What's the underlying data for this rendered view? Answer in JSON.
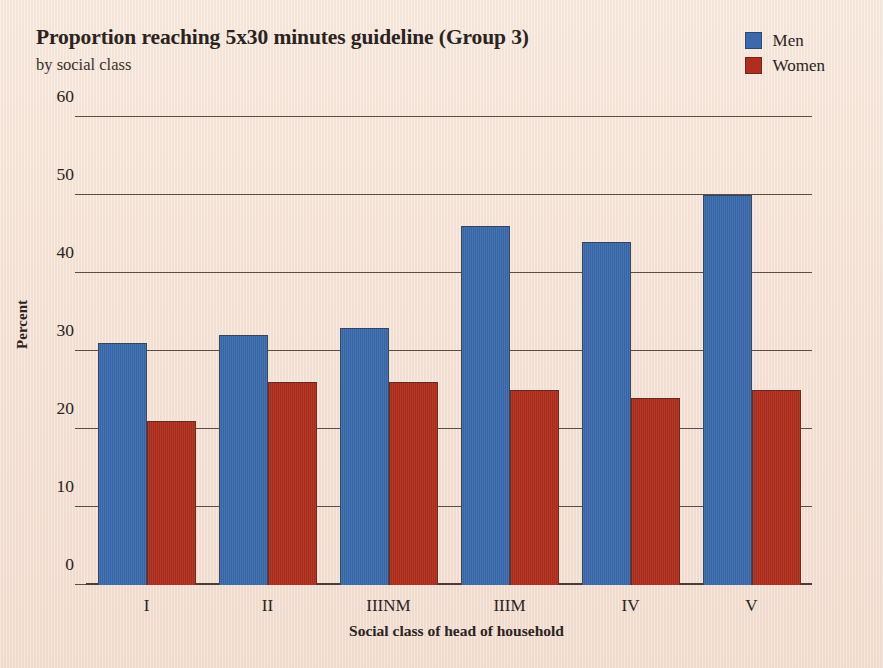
{
  "chart_data": {
    "type": "bar",
    "title": "Proportion reaching 5x30 minutes guideline (Group 3)",
    "subtitle": "by social class",
    "xlabel": "Social class of head of household",
    "ylabel": "Percent",
    "categories": [
      "I",
      "II",
      "IIINM",
      "IIIM",
      "IV",
      "V"
    ],
    "series": [
      {
        "name": "Men",
        "color": "#3a6aac",
        "values": [
          31,
          32,
          33,
          46,
          44,
          50
        ]
      },
      {
        "name": "Women",
        "color": "#b02e1e",
        "values": [
          21,
          26,
          26,
          25,
          24,
          25
        ]
      }
    ],
    "ylim": [
      0,
      60
    ],
    "yticks": [
      0,
      10,
      20,
      30,
      40,
      50,
      60
    ],
    "ytick_labels": [
      "0",
      "10",
      "20",
      "30",
      "40",
      "50",
      "60"
    ],
    "grid": "horizontal",
    "legend_position": "top-right",
    "background_color": "#f5e2d4"
  }
}
